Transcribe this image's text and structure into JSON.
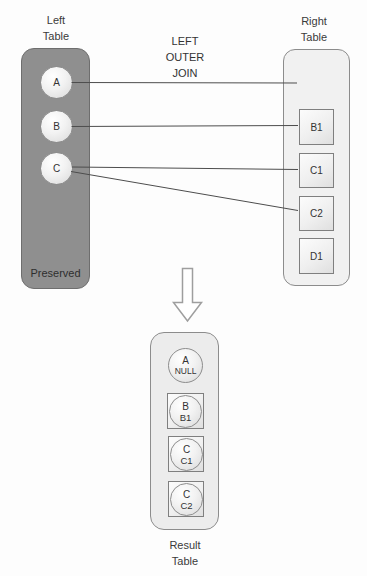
{
  "diagram_title": "LEFT OUTER JOIN visualization",
  "join_label": [
    "LEFT",
    "OUTER",
    "JOIN"
  ],
  "left_table": {
    "title": [
      "Left",
      "Table"
    ],
    "rows": [
      "A",
      "B",
      "C"
    ],
    "footer": "Preserved",
    "fill_color": "#8f8f8f"
  },
  "right_table": {
    "title": [
      "Right",
      "Table"
    ],
    "rows": [
      "B1",
      "C1",
      "C2",
      "D1"
    ]
  },
  "connections": [
    {
      "from": "A",
      "to": "no-match"
    },
    {
      "from": "B",
      "to": "B1"
    },
    {
      "from": "C",
      "to": "C1"
    },
    {
      "from": "C",
      "to": "C2"
    }
  ],
  "result_table": {
    "title": [
      "Result",
      "Table"
    ],
    "rows": [
      {
        "left_value": "A",
        "right_value": "NULL",
        "matched": false
      },
      {
        "left_value": "B",
        "right_value": "B1",
        "matched": true
      },
      {
        "left_value": "C",
        "right_value": "C1",
        "matched": true
      },
      {
        "left_value": "C",
        "right_value": "C2",
        "matched": true
      }
    ]
  }
}
